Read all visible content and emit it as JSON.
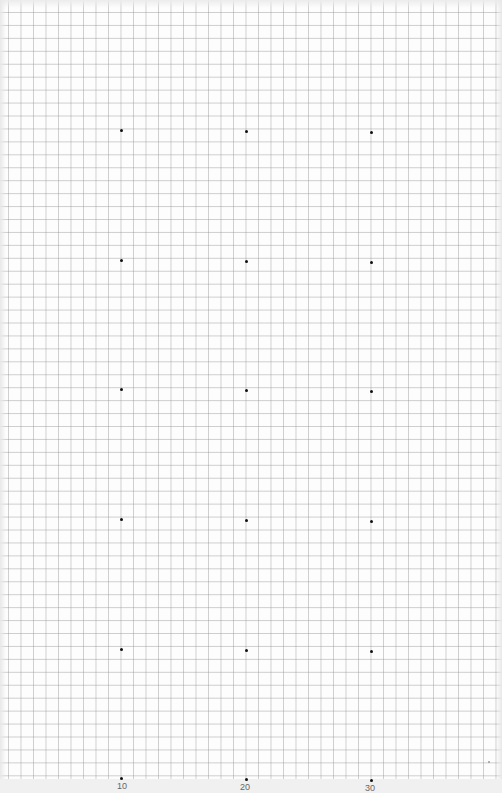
{
  "page": {
    "type": "graph-paper",
    "grid_color": "#a0a0a0",
    "dot_color": "#111111"
  },
  "dots": {
    "columns_x": [
      121,
      246,
      371
    ],
    "rows_y": [
      130,
      260,
      389,
      519,
      649,
      778
    ]
  },
  "labels": [
    {
      "text": "10",
      "x": 122
    },
    {
      "text": "20",
      "x": 245
    },
    {
      "text": "30",
      "x": 370
    }
  ]
}
